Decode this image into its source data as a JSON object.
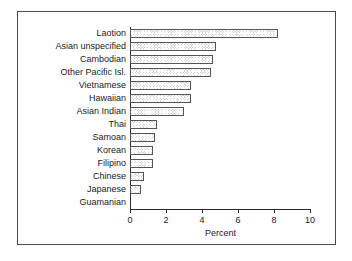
{
  "chart_data": {
    "type": "bar",
    "orientation": "horizontal",
    "title": "",
    "xlabel": "Percent",
    "ylabel": "",
    "xlim": [
      0,
      10
    ],
    "xticks": [
      "0",
      "2",
      "4",
      "6",
      "8",
      "10"
    ],
    "xtick_values": [
      0,
      2,
      4,
      6,
      8,
      10
    ],
    "grid": false,
    "legend": false,
    "categories": [
      "Laotion",
      "Asian unspecified",
      "Cambodian",
      "Other Pacific Isl.",
      "Vietnamese",
      "Hawaiian",
      "Asian Indian",
      "Thai",
      "Samoan",
      "Korean",
      "Filipino",
      "Chinese",
      "Japanese",
      "Guamanian"
    ],
    "values": [
      8.2,
      4.8,
      4.6,
      4.5,
      3.4,
      3.4,
      3.0,
      1.5,
      1.4,
      1.3,
      1.3,
      0.75,
      0.6,
      0.0
    ],
    "bar_fill_color": "#d2d2d2",
    "bar_edge_color": "#555555",
    "axis_color": "#2b2b2b",
    "background_color": "#ffffff"
  }
}
